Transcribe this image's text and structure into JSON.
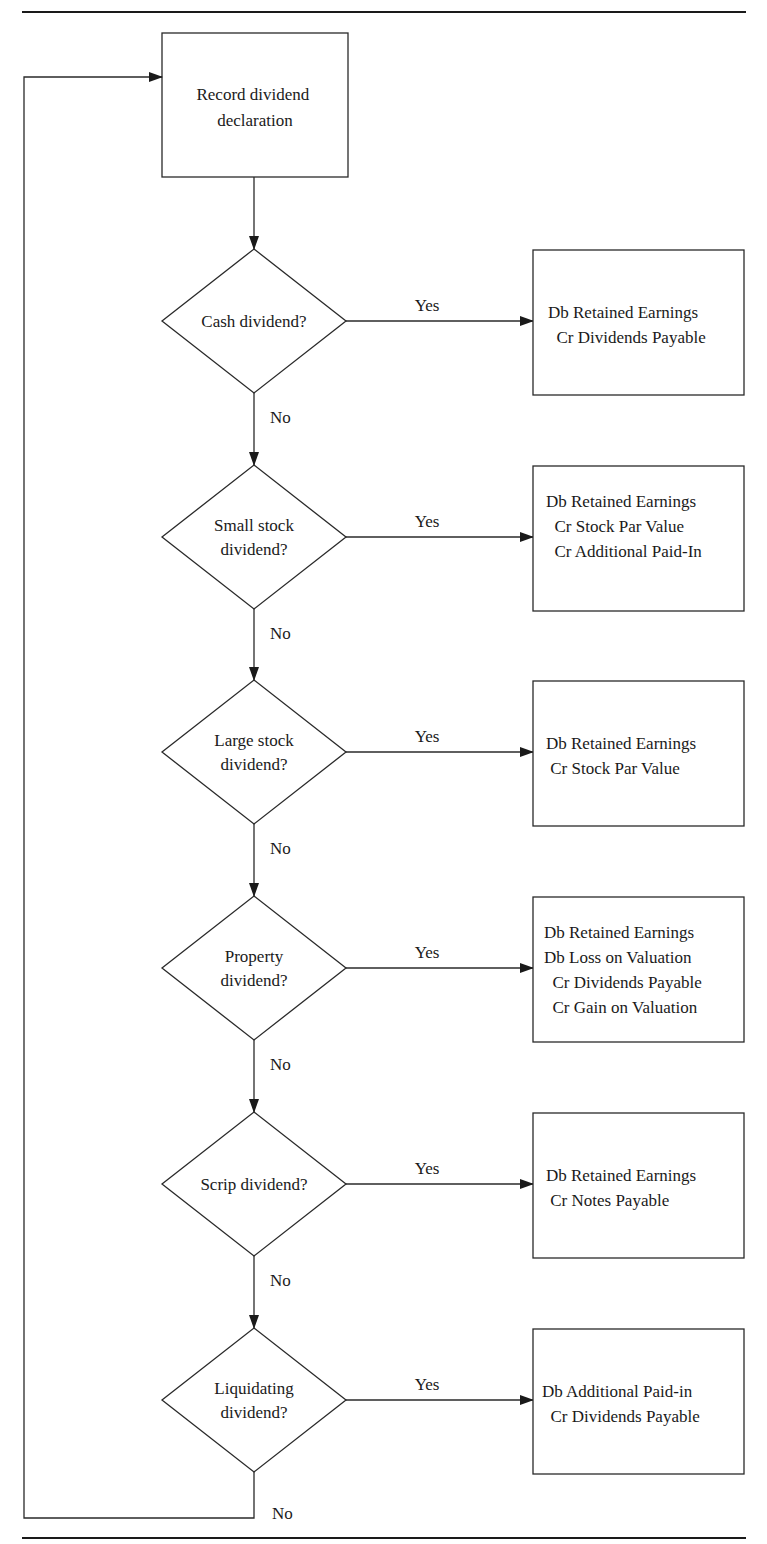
{
  "start": {
    "lines": [
      "Record dividend",
      "declaration"
    ]
  },
  "labels": {
    "yes": "Yes",
    "no": "No"
  },
  "decisions": [
    {
      "question": [
        "Cash dividend?"
      ],
      "entry": [
        "Db Retained Earnings",
        "  Cr Dividends Payable"
      ]
    },
    {
      "question": [
        "Small stock",
        "dividend?"
      ],
      "entry": [
        "Db Retained Earnings",
        "  Cr Stock Par Value",
        "  Cr Additional Paid-In"
      ]
    },
    {
      "question": [
        "Large stock",
        "dividend?"
      ],
      "entry": [
        "Db Retained Earnings",
        " Cr Stock Par Value"
      ]
    },
    {
      "question": [
        "Property",
        "dividend?"
      ],
      "entry": [
        "Db Retained Earnings",
        "Db Loss on Valuation",
        "  Cr Dividends Payable",
        "  Cr Gain on Valuation"
      ]
    },
    {
      "question": [
        "Scrip dividend?"
      ],
      "entry": [
        "Db Retained Earnings",
        " Cr Notes Payable"
      ]
    },
    {
      "question": [
        "Liquidating",
        "dividend?"
      ],
      "entry": [
        "Db Additional Paid-in",
        "  Cr Dividends Payable"
      ]
    }
  ],
  "colors": {
    "stroke": "#2a2a2a",
    "text": "#1a1a1a",
    "background": "#ffffff"
  }
}
